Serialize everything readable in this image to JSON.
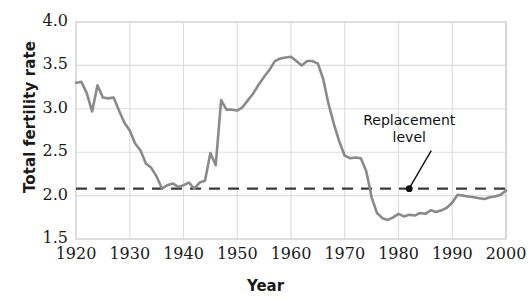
{
  "chart_data": {
    "type": "line",
    "title": "",
    "xlabel": "Year",
    "ylabel": "Total fertility rate",
    "xlim": [
      1920,
      2000
    ],
    "ylim": [
      1.5,
      4.0
    ],
    "grid": true,
    "legend": false,
    "x_ticks": [
      "1920",
      "1930",
      "1940",
      "1950",
      "1960",
      "1970",
      "1980",
      "1990",
      "2000"
    ],
    "y_ticks": [
      "1.5",
      "2.0",
      "2.5",
      "3.0",
      "3.5",
      "4.0"
    ],
    "line_color": "#8a8a8a",
    "annotations": [
      {
        "text_line1": "Replacement",
        "text_line2": "level",
        "points_to_x": 1982,
        "points_to_y": 2.08
      }
    ],
    "reference_line": {
      "label": "Replacement level",
      "value": 2.08,
      "style": "dashed",
      "color": "#3a3a3a"
    },
    "series": [
      {
        "name": "Total fertility rate",
        "x": [
          1920,
          1921,
          1922,
          1923,
          1924,
          1925,
          1926,
          1927,
          1928,
          1929,
          1930,
          1931,
          1932,
          1933,
          1934,
          1935,
          1936,
          1937,
          1938,
          1939,
          1940,
          1941,
          1942,
          1943,
          1944,
          1945,
          1946,
          1947,
          1948,
          1949,
          1950,
          1951,
          1952,
          1953,
          1954,
          1955,
          1956,
          1957,
          1958,
          1959,
          1960,
          1961,
          1962,
          1963,
          1964,
          1965,
          1966,
          1967,
          1968,
          1969,
          1970,
          1971,
          1972,
          1973,
          1974,
          1975,
          1976,
          1977,
          1978,
          1979,
          1980,
          1981,
          1982,
          1983,
          1984,
          1985,
          1986,
          1987,
          1988,
          1989,
          1990,
          1991,
          1992,
          1993,
          1994,
          1995,
          1996,
          1997,
          1998,
          1999,
          2000
        ],
        "y": [
          3.3,
          3.31,
          3.18,
          2.97,
          3.27,
          3.13,
          3.12,
          3.13,
          2.98,
          2.84,
          2.75,
          2.6,
          2.52,
          2.37,
          2.32,
          2.22,
          2.08,
          2.12,
          2.14,
          2.1,
          2.12,
          2.15,
          2.08,
          2.15,
          2.17,
          2.49,
          2.35,
          3.1,
          2.99,
          2.99,
          2.98,
          3.02,
          3.1,
          3.18,
          3.28,
          3.37,
          3.45,
          3.55,
          3.58,
          3.59,
          3.6,
          3.55,
          3.5,
          3.55,
          3.55,
          3.52,
          3.34,
          3.05,
          2.82,
          2.62,
          2.46,
          2.43,
          2.44,
          2.43,
          2.28,
          1.98,
          1.8,
          1.74,
          1.72,
          1.75,
          1.79,
          1.76,
          1.78,
          1.77,
          1.8,
          1.79,
          1.83,
          1.81,
          1.83,
          1.86,
          1.92,
          2.01,
          2.0,
          1.99,
          1.98,
          1.97,
          1.96,
          1.98,
          1.99,
          2.01,
          2.06
        ]
      }
    ]
  }
}
